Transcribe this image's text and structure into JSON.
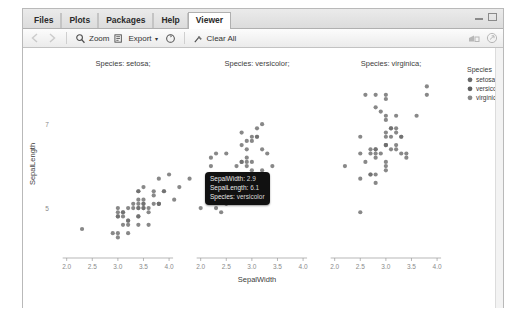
{
  "window": {
    "minimize_icon": "minimize-icon",
    "maximize_icon": "maximize-icon"
  },
  "tabs": [
    {
      "label": "Files",
      "active": false
    },
    {
      "label": "Plots",
      "active": false
    },
    {
      "label": "Packages",
      "active": false
    },
    {
      "label": "Help",
      "active": false
    },
    {
      "label": "Viewer",
      "active": true
    }
  ],
  "toolbar": {
    "back_icon": "back-arrow-icon",
    "forward_icon": "forward-arrow-icon",
    "zoom_label": "Zoom",
    "zoom_icon": "magnifier-icon",
    "export_label": "Export",
    "export_caret": "▾",
    "export_icon": "export-icon",
    "refresh_icon": "refresh-icon",
    "clear_label": "Clear All",
    "clear_icon": "broom-icon",
    "publish_icon": "publish-icon",
    "newwindow_icon": "new-window-icon"
  },
  "tooltip": {
    "rows": [
      {
        "key": "SepalWidth:",
        "value": "2.9"
      },
      {
        "key": "SepalLength:",
        "value": "6.1"
      },
      {
        "key": "Species:",
        "value": "versicolor"
      }
    ]
  },
  "chart_data": {
    "type": "scatter",
    "title": "",
    "xlabel": "SepalWidth",
    "ylabel": "SepalLength",
    "xlim": [
      1.85,
      4.35
    ],
    "ylim": [
      4.0,
      8.1
    ],
    "xticks": [
      2.0,
      2.5,
      3.0,
      3.5,
      4.0
    ],
    "xtick_labels": [
      "2.0",
      "2.5",
      "3.0",
      "3.5",
      "4.0"
    ],
    "yticks": [
      5,
      7
    ],
    "ytick_labels": [
      "5",
      "7"
    ],
    "grid": false,
    "facet_by": "Species",
    "point_color": "#6e6e6e",
    "point_radius": 2.1,
    "legend": {
      "position": "right",
      "title": "Species",
      "entries": [
        {
          "label": "setosa",
          "color": "#6b6b6b"
        },
        {
          "label": "versicolor",
          "color": "#5f5f5f"
        },
        {
          "label": "virginica",
          "color": "#888888"
        }
      ]
    },
    "facets": [
      {
        "title": "Species: setosa;",
        "name": "setosa",
        "points": [
          [
            3.5,
            5.1
          ],
          [
            3.0,
            4.9
          ],
          [
            3.2,
            4.7
          ],
          [
            3.1,
            4.6
          ],
          [
            3.6,
            5.0
          ],
          [
            3.9,
            5.4
          ],
          [
            3.4,
            4.6
          ],
          [
            3.4,
            5.0
          ],
          [
            2.9,
            4.4
          ],
          [
            3.1,
            4.9
          ],
          [
            3.7,
            5.4
          ],
          [
            3.4,
            4.8
          ],
          [
            3.0,
            4.8
          ],
          [
            3.0,
            4.3
          ],
          [
            4.0,
            5.8
          ],
          [
            4.4,
            5.7
          ],
          [
            3.9,
            5.4
          ],
          [
            3.5,
            5.1
          ],
          [
            3.8,
            5.7
          ],
          [
            3.8,
            5.1
          ],
          [
            3.4,
            5.4
          ],
          [
            3.7,
            5.1
          ],
          [
            3.6,
            4.6
          ],
          [
            3.3,
            5.1
          ],
          [
            3.4,
            4.8
          ],
          [
            3.0,
            5.0
          ],
          [
            3.4,
            5.0
          ],
          [
            3.5,
            5.2
          ],
          [
            3.4,
            5.2
          ],
          [
            3.2,
            4.7
          ],
          [
            3.1,
            4.8
          ],
          [
            3.4,
            5.4
          ],
          [
            4.1,
            5.2
          ],
          [
            4.2,
            5.5
          ],
          [
            3.1,
            4.9
          ],
          [
            3.2,
            5.0
          ],
          [
            3.5,
            5.5
          ],
          [
            3.6,
            4.9
          ],
          [
            3.0,
            4.4
          ],
          [
            3.4,
            5.1
          ],
          [
            3.5,
            5.0
          ],
          [
            2.3,
            4.5
          ],
          [
            3.2,
            4.4
          ],
          [
            3.5,
            5.0
          ],
          [
            3.8,
            5.1
          ],
          [
            3.0,
            4.8
          ],
          [
            3.8,
            5.1
          ],
          [
            3.2,
            4.6
          ],
          [
            3.7,
            5.3
          ],
          [
            3.3,
            5.0
          ]
        ]
      },
      {
        "title": "Species: versicolor;",
        "name": "versicolor",
        "points": [
          [
            3.2,
            7.0
          ],
          [
            3.2,
            6.4
          ],
          [
            3.1,
            6.9
          ],
          [
            2.3,
            5.5
          ],
          [
            2.8,
            6.5
          ],
          [
            2.8,
            5.7
          ],
          [
            3.3,
            6.3
          ],
          [
            2.4,
            4.9
          ],
          [
            2.9,
            6.6
          ],
          [
            2.7,
            5.2
          ],
          [
            2.0,
            5.0
          ],
          [
            3.0,
            5.9
          ],
          [
            2.2,
            6.0
          ],
          [
            2.9,
            6.1
          ],
          [
            2.9,
            5.6
          ],
          [
            3.1,
            6.7
          ],
          [
            3.0,
            5.6
          ],
          [
            2.7,
            5.8
          ],
          [
            2.2,
            6.2
          ],
          [
            2.5,
            5.6
          ],
          [
            3.2,
            5.9
          ],
          [
            2.8,
            6.1
          ],
          [
            2.5,
            6.3
          ],
          [
            2.8,
            6.1
          ],
          [
            2.9,
            6.4
          ],
          [
            3.0,
            6.6
          ],
          [
            2.8,
            6.8
          ],
          [
            3.0,
            6.7
          ],
          [
            2.9,
            6.0
          ],
          [
            2.6,
            5.7
          ],
          [
            2.4,
            5.5
          ],
          [
            2.4,
            5.5
          ],
          [
            2.7,
            5.8
          ],
          [
            2.7,
            6.0
          ],
          [
            3.0,
            5.4
          ],
          [
            3.4,
            6.0
          ],
          [
            3.1,
            6.7
          ],
          [
            2.3,
            6.3
          ],
          [
            3.0,
            5.6
          ],
          [
            2.5,
            5.5
          ],
          [
            2.6,
            5.5
          ],
          [
            3.0,
            6.1
          ],
          [
            2.6,
            5.8
          ],
          [
            2.3,
            5.0
          ],
          [
            2.7,
            5.6
          ],
          [
            3.0,
            5.7
          ],
          [
            2.9,
            5.7
          ],
          [
            2.9,
            6.2
          ],
          [
            2.5,
            5.1
          ],
          [
            2.8,
            5.7
          ]
        ]
      },
      {
        "title": "Species: virginica;",
        "name": "virginica",
        "points": [
          [
            3.3,
            6.3
          ],
          [
            2.7,
            5.8
          ],
          [
            3.0,
            7.1
          ],
          [
            2.9,
            6.3
          ],
          [
            3.0,
            6.5
          ],
          [
            3.0,
            7.6
          ],
          [
            2.5,
            4.9
          ],
          [
            2.9,
            7.3
          ],
          [
            2.5,
            6.7
          ],
          [
            3.6,
            7.2
          ],
          [
            3.2,
            6.5
          ],
          [
            2.7,
            6.4
          ],
          [
            3.0,
            6.8
          ],
          [
            2.5,
            5.7
          ],
          [
            2.8,
            5.8
          ],
          [
            3.2,
            6.4
          ],
          [
            3.0,
            6.5
          ],
          [
            3.8,
            7.7
          ],
          [
            2.6,
            7.7
          ],
          [
            2.2,
            6.0
          ],
          [
            3.2,
            6.9
          ],
          [
            2.8,
            5.6
          ],
          [
            2.8,
            7.7
          ],
          [
            2.7,
            6.3
          ],
          [
            3.3,
            6.7
          ],
          [
            3.2,
            7.2
          ],
          [
            2.8,
            6.2
          ],
          [
            3.0,
            6.1
          ],
          [
            2.8,
            6.4
          ],
          [
            3.0,
            7.2
          ],
          [
            2.8,
            7.4
          ],
          [
            3.8,
            7.9
          ],
          [
            2.8,
            6.4
          ],
          [
            2.8,
            6.3
          ],
          [
            2.6,
            6.1
          ],
          [
            3.0,
            7.7
          ],
          [
            3.4,
            6.3
          ],
          [
            3.1,
            6.4
          ],
          [
            3.0,
            6.0
          ],
          [
            3.1,
            6.9
          ],
          [
            3.1,
            6.7
          ],
          [
            3.1,
            6.9
          ],
          [
            2.7,
            5.8
          ],
          [
            3.2,
            6.8
          ],
          [
            3.3,
            6.7
          ],
          [
            3.0,
            6.7
          ],
          [
            2.5,
            6.3
          ],
          [
            3.0,
            6.5
          ],
          [
            3.4,
            6.2
          ],
          [
            3.0,
            5.9
          ]
        ]
      }
    ]
  }
}
